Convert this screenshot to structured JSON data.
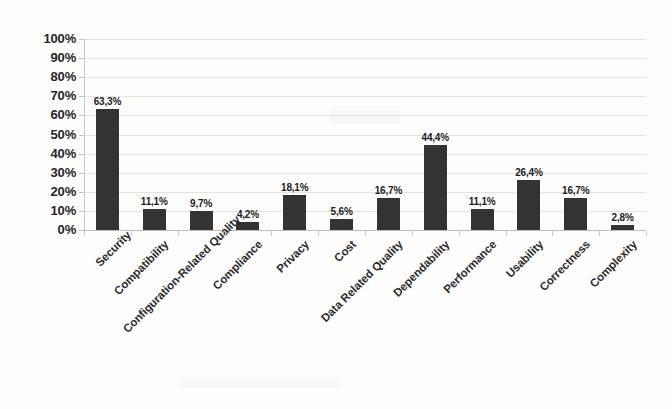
{
  "chart_data": {
    "type": "bar",
    "title": "",
    "subtitle": "",
    "xlabel": "",
    "ylabel": "",
    "ylim": [
      0,
      100
    ],
    "ytick_step": 10,
    "ytick_labels": [
      "100%",
      "90%",
      "80%",
      "70%",
      "60%",
      "50%",
      "40%",
      "30%",
      "20%",
      "10%",
      "0%"
    ],
    "grid": true,
    "legend": false,
    "legend_position": "none",
    "decimal_separator": ",",
    "value_suffix": "%",
    "bar_color": "#333333",
    "gridline_color": "#d9d9d9",
    "axis_color": "#c4c4c4",
    "background_color": "#fdfdfc",
    "label_rotation_deg": -45,
    "categories": [
      "Security",
      "Compatibility",
      "Configuration-Related Quality",
      "Compliance",
      "Privacy",
      "Cost",
      "Data Related Quality",
      "Dependability",
      "Performance",
      "Usability",
      "Correctness",
      "Complexity"
    ],
    "values": [
      63.3,
      11.1,
      9.7,
      4.2,
      18.1,
      5.6,
      16.7,
      44.4,
      11.1,
      26.4,
      16.7,
      2.8
    ],
    "value_labels": [
      "63,3%",
      "11,1%",
      "9,7%",
      "4,2%",
      "18,1%",
      "5,6%",
      "16,7%",
      "44,4%",
      "11,1%",
      "26,4%",
      "16,7%",
      "2,8%"
    ]
  }
}
